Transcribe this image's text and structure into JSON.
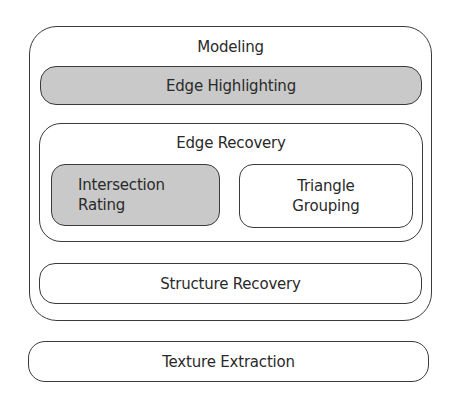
{
  "diagram": {
    "modeling": {
      "title": "Modeling",
      "edge_highlighting": {
        "label": "Edge Highlighting",
        "fill": "#c9c9c9"
      },
      "edge_recovery": {
        "title": "Edge Recovery",
        "intersection_rating": {
          "label": "Intersection\nRating",
          "fill": "#c9c9c9"
        },
        "triangle_grouping": {
          "label": "Triangle\nGrouping",
          "fill": "#ffffff"
        }
      },
      "structure_recovery": {
        "label": "Structure Recovery",
        "fill": "#ffffff"
      }
    },
    "texture_extraction": {
      "label": "Texture Extraction",
      "fill": "#ffffff"
    },
    "colors": {
      "stroke": "#3a3a3a",
      "highlight_fill": "#c9c9c9",
      "text": "#2a2a2a",
      "background": "#ffffff"
    }
  }
}
